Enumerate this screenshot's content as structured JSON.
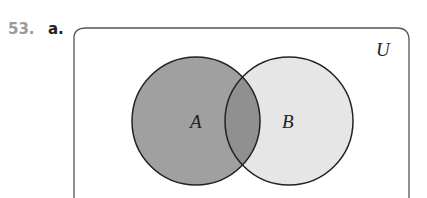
{
  "problem": {
    "number": "53.",
    "part": "a."
  },
  "diagram": {
    "universal_label": "U",
    "sets": [
      {
        "label": "A",
        "fill": "#9e9e9e",
        "shaded": true
      },
      {
        "label": "B",
        "fill": "#e6e6e6",
        "shaded": false
      }
    ],
    "intersection_fill": "#8f8f8f",
    "border_color": "#333333"
  }
}
